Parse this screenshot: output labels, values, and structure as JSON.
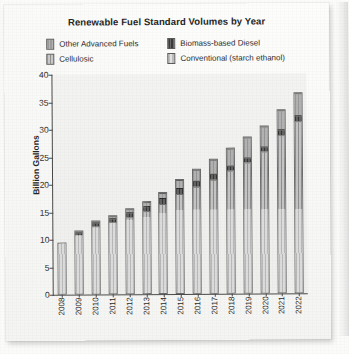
{
  "chart_data": {
    "type": "bar",
    "subtype": "stacked-bar",
    "title": "Renewable Fuel Standard Volumes by Year",
    "xlabel": "",
    "ylabel": "Billion Gallons",
    "ylim": [
      0,
      40
    ],
    "yticks": [
      0,
      5,
      10,
      15,
      20,
      25,
      30,
      35,
      40
    ],
    "grid": false,
    "legend_position": "top",
    "categories": [
      "2008",
      "2009",
      "2010",
      "2011",
      "2012",
      "2013",
      "2014",
      "2015",
      "2016",
      "2017",
      "2018",
      "2019",
      "2020",
      "2021",
      "2022"
    ],
    "series": [
      {
        "name": "Conventional (starch ethanol)",
        "swatch": "sw-con",
        "color": "#d2d2d2",
        "values": [
          9.0,
          10.5,
          12.0,
          12.6,
          13.2,
          13.8,
          14.4,
          15.0,
          15.0,
          15.0,
          15.0,
          15.0,
          15.0,
          15.0,
          15.0
        ]
      },
      {
        "name": "Cellulosic",
        "swatch": "sw-cel",
        "color": "#b0b0b0",
        "values": [
          0.0,
          0.0,
          0.1,
          0.25,
          0.5,
          1.0,
          1.75,
          3.0,
          4.25,
          5.5,
          7.0,
          8.5,
          10.5,
          13.5,
          16.0
        ]
      },
      {
        "name": "Biomass-based Diesel",
        "swatch": "sw-bbd",
        "color": "#4a4a4a",
        "values": [
          0.0,
          0.5,
          0.65,
          0.8,
          1.0,
          1.0,
          1.0,
          1.0,
          1.0,
          1.0,
          1.0,
          1.0,
          1.0,
          1.0,
          1.0
        ]
      },
      {
        "name": "Other Advanced Fuels",
        "swatch": "sw-oaf",
        "color": "#a5a5a5",
        "values": [
          0.0,
          0.1,
          0.2,
          0.3,
          0.5,
          0.75,
          1.0,
          1.5,
          2.0,
          2.5,
          3.0,
          3.5,
          3.5,
          3.5,
          4.0
        ]
      }
    ],
    "totals": [
      9.0,
      11.1,
      12.95,
      13.95,
      15.2,
      16.55,
      18.15,
      20.5,
      22.25,
      24.0,
      26.0,
      28.0,
      30.0,
      33.0,
      36.0
    ]
  },
  "legend": {
    "rows": [
      [
        {
          "label": "Other Advanced Fuels",
          "swatch": "sw-oaf"
        },
        {
          "label": "Biomass-based Diesel",
          "swatch": "sw-bbd"
        }
      ],
      [
        {
          "label": "Cellulosic",
          "swatch": "sw-cel"
        },
        {
          "label": "Conventional (starch ethanol)",
          "swatch": "sw-con"
        }
      ]
    ]
  }
}
